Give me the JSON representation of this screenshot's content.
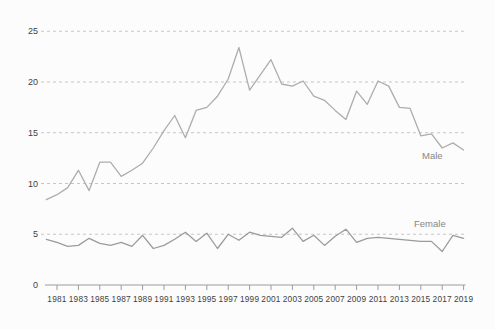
{
  "figure": {
    "background": "#fcfcfc",
    "grid_color": "#c6c6c6",
    "axis_color": "#9c9c9c",
    "text_color": "#3f3f3f",
    "label_color": "#868686"
  },
  "chart_data": {
    "type": "line",
    "title": "",
    "xlabel": "",
    "ylabel": "",
    "x": [
      1980,
      1981,
      1982,
      1983,
      1984,
      1985,
      1986,
      1987,
      1988,
      1989,
      1990,
      1991,
      1992,
      1993,
      1994,
      1995,
      1996,
      1997,
      1998,
      1999,
      2000,
      2001,
      2002,
      2003,
      2004,
      2005,
      2006,
      2007,
      2008,
      2009,
      2010,
      2011,
      2012,
      2013,
      2014,
      2015,
      2016,
      2017,
      2018,
      2019
    ],
    "series": [
      {
        "name": "Male",
        "color": "#adadad",
        "values": [
          8.4,
          8.9,
          9.6,
          11.3,
          9.3,
          12.1,
          12.1,
          10.7,
          11.3,
          12.0,
          13.5,
          15.2,
          16.7,
          14.5,
          17.2,
          17.5,
          18.6,
          20.3,
          23.4,
          19.2,
          20.7,
          22.2,
          19.8,
          19.6,
          20.1,
          18.6,
          18.2,
          17.2,
          16.3,
          19.1,
          17.8,
          20.1,
          19.6,
          17.5,
          17.4,
          14.7,
          14.9,
          13.5,
          14.0,
          13.3
        ]
      },
      {
        "name": "Female",
        "color": "#9b9b9b",
        "values": [
          4.5,
          4.2,
          3.8,
          3.9,
          4.6,
          4.1,
          3.9,
          4.2,
          3.8,
          4.9,
          3.6,
          3.9,
          4.5,
          5.2,
          4.3,
          5.1,
          3.6,
          5.0,
          4.4,
          5.2,
          4.9,
          4.8,
          4.7,
          5.6,
          4.3,
          4.9,
          3.9,
          4.8,
          5.5,
          4.2,
          4.6,
          4.7,
          4.6,
          4.5,
          4.4,
          4.3,
          4.3,
          3.3,
          4.9,
          4.6
        ]
      }
    ],
    "ylim": [
      0,
      25
    ],
    "yticks": [
      0,
      5,
      10,
      15,
      20,
      25
    ],
    "xtick_labels": [
      "1981",
      "1983",
      "1985",
      "1987",
      "1989",
      "1991",
      "1993",
      "1995",
      "1997",
      "1999",
      "2001",
      "2003",
      "2005",
      "2007",
      "2009",
      "2011",
      "2013",
      "2015",
      "2017",
      "2019"
    ],
    "grid": "horizontal dashed gridlines at yticks",
    "legend": "inline series labels at right end of lines (Male above, Female below)"
  }
}
